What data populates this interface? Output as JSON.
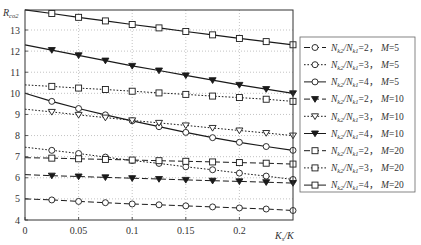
{
  "chart_data": {
    "type": "line",
    "title": "",
    "xlabel": "K_s/K",
    "ylabel": "R_co2",
    "xlim": [
      0,
      0.25
    ],
    "ylim": [
      4,
      13.95
    ],
    "grid": true,
    "legend_position": "right",
    "x_ticks": [
      0,
      0.05,
      0.1,
      0.15,
      0.2
    ],
    "x_tick_labels": [
      "0",
      "0.05",
      "0.1",
      "0.15",
      "0.2"
    ],
    "y_ticks": [
      4,
      5,
      6,
      7,
      8,
      9,
      10,
      11,
      12,
      13
    ],
    "y_tick_labels": [
      "4",
      "5",
      "6",
      "7",
      "8",
      "9",
      "10",
      "11",
      "12",
      "13"
    ],
    "x": [
      0,
      0.025,
      0.05,
      0.075,
      0.1,
      0.125,
      0.15,
      0.175,
      0.2,
      0.225,
      0.25
    ],
    "series": [
      {
        "name": "N_k2/N_k1=2, M=5",
        "ratio": "2",
        "M": "5",
        "line": "dashed",
        "marker": "circle",
        "values": [
          5.0,
          4.95,
          4.88,
          4.82,
          4.76,
          4.72,
          4.67,
          4.62,
          4.57,
          4.52,
          4.45
        ]
      },
      {
        "name": "N_k2/N_k1=3, M=5",
        "ratio": "3",
        "M": "5",
        "line": "dotted",
        "marker": "circle",
        "values": [
          7.45,
          7.3,
          7.15,
          6.98,
          6.82,
          6.68,
          6.52,
          6.38,
          6.22,
          6.08,
          5.92
        ]
      },
      {
        "name": "N_k2/N_k1=4, M=5",
        "ratio": "4",
        "M": "5",
        "line": "solid",
        "marker": "circle",
        "values": [
          10.0,
          9.62,
          9.28,
          8.98,
          8.7,
          8.42,
          8.15,
          7.9,
          7.68,
          7.48,
          7.3
        ]
      },
      {
        "name": "N_k2/N_k1=2, M=10",
        "ratio": "2",
        "M": "10",
        "line": "dashed",
        "marker": "triangle-down",
        "values": [
          6.15,
          6.1,
          6.06,
          6.02,
          5.98,
          5.94,
          5.9,
          5.86,
          5.83,
          5.79,
          5.75
        ]
      },
      {
        "name": "N_k2/N_k1=3, M=10",
        "ratio": "3",
        "M": "10",
        "line": "dotted",
        "marker": "triangle-up-open",
        "values": [
          9.25,
          9.12,
          8.98,
          8.85,
          8.72,
          8.6,
          8.48,
          8.36,
          8.24,
          8.12,
          8.0
        ]
      },
      {
        "name": "N_k2/N_k1=4, M=10",
        "ratio": "4",
        "M": "10",
        "line": "solid",
        "marker": "triangle-down",
        "values": [
          12.3,
          12.05,
          11.8,
          11.55,
          11.3,
          11.08,
          10.85,
          10.62,
          10.4,
          10.2,
          10.0
        ]
      },
      {
        "name": "N_k2/N_k1=2, M=20",
        "ratio": "2",
        "M": "20",
        "line": "dashed",
        "marker": "square",
        "values": [
          6.95,
          6.93,
          6.9,
          6.87,
          6.84,
          6.81,
          6.78,
          6.75,
          6.72,
          6.69,
          6.65
        ]
      },
      {
        "name": "N_k2/N_k1=3, M=20",
        "ratio": "3",
        "M": "20",
        "line": "dotted",
        "marker": "square",
        "values": [
          10.4,
          10.33,
          10.25,
          10.18,
          10.1,
          10.02,
          9.95,
          9.87,
          9.8,
          9.72,
          9.62
        ]
      },
      {
        "name": "N_k2/N_k1=4, M=20",
        "ratio": "4",
        "M": "20",
        "line": "solid",
        "marker": "square",
        "values": [
          13.95,
          13.78,
          13.6,
          13.43,
          13.26,
          13.1,
          12.93,
          12.77,
          12.6,
          12.45,
          12.3
        ]
      }
    ]
  },
  "axes": {
    "ylabel_main": "R",
    "ylabel_sub": "co2",
    "xlabel_main": "K",
    "xlabel_sub": "s",
    "xlabel_tail": "/K"
  },
  "legend": {
    "items": [
      {
        "n_main": "N",
        "n_sub1": "k2",
        "slash": "/",
        "d_main": "N",
        "d_sub": "k1",
        "eq": "=2，",
        "m_label": "M",
        "m_eq": "=5"
      },
      {
        "n_main": "N",
        "n_sub1": "k2",
        "slash": "/",
        "d_main": "N",
        "d_sub": "k1",
        "eq": "=3，",
        "m_label": "M",
        "m_eq": "=5"
      },
      {
        "n_main": "N",
        "n_sub1": "k2",
        "slash": "/",
        "d_main": "N",
        "d_sub": "k1",
        "eq": "=4，",
        "m_label": "M",
        "m_eq": "=5"
      },
      {
        "n_main": "N",
        "n_sub1": "k2",
        "slash": "/",
        "d_main": "N",
        "d_sub": "k1",
        "eq": "=2，",
        "m_label": "M",
        "m_eq": "=10"
      },
      {
        "n_main": "N",
        "n_sub1": "k2",
        "slash": "/",
        "d_main": "N",
        "d_sub": "k1",
        "eq": "=3，",
        "m_label": "M",
        "m_eq": "=10"
      },
      {
        "n_main": "N",
        "n_sub1": "k2",
        "slash": "/",
        "d_main": "N",
        "d_sub": "k1",
        "eq": "=4，",
        "m_label": "M",
        "m_eq": "=10"
      },
      {
        "n_main": "N",
        "n_sub1": "k2",
        "slash": "/",
        "d_main": "N",
        "d_sub": "k1",
        "eq": "=2，",
        "m_label": "M",
        "m_eq": "=20"
      },
      {
        "n_main": "N",
        "n_sub1": "k2",
        "slash": "/",
        "d_main": "N",
        "d_sub": "k1",
        "eq": "=3，",
        "m_label": "M",
        "m_eq": "=20"
      },
      {
        "n_main": "N",
        "n_sub1": "k2",
        "slash": "/",
        "d_main": "N",
        "d_sub": "k1",
        "eq": "=4，",
        "m_label": "M",
        "m_eq": "=20"
      }
    ]
  },
  "colors": {
    "line": "#1a1a1a",
    "grid": "#9a9a9a",
    "axis": "#333333",
    "legend_border": "#666666",
    "background": "#ffffff"
  }
}
